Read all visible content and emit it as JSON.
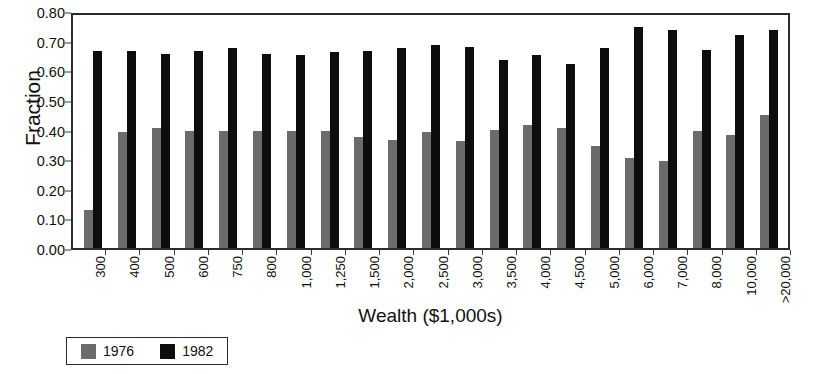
{
  "chart_data": {
    "type": "bar",
    "title": "",
    "xlabel": "Wealth ($1,000s)",
    "ylabel": "Fraction",
    "ylim": [
      0.0,
      0.8
    ],
    "yticks": [
      "0.00",
      "0.10",
      "0.20",
      "0.30",
      "0.40",
      "0.50",
      "0.60",
      "0.70",
      "0.80"
    ],
    "ytick_values": [
      0.0,
      0.1,
      0.2,
      0.3,
      0.4,
      0.5,
      0.6,
      0.7,
      0.8
    ],
    "grid": false,
    "legend_position": "bottom-left",
    "categories": [
      "300",
      "400",
      "500",
      "600",
      "750",
      "800",
      "1,000",
      "1,250",
      "1,500",
      "2,000",
      "2,500",
      "3,000",
      "3,500",
      "4,000",
      "4,500",
      "5,000",
      "6,000",
      "7,000",
      "8,000",
      "10,000",
      ">20,000"
    ],
    "series": [
      {
        "name": "1976",
        "color": "#6b6b6b",
        "values": [
          0.13,
          0.39,
          0.405,
          0.395,
          0.395,
          0.395,
          0.395,
          0.395,
          0.375,
          0.365,
          0.39,
          0.36,
          0.4,
          0.415,
          0.405,
          0.345,
          0.305,
          0.295,
          0.395,
          0.38,
          0.45
        ]
      },
      {
        "name": "1982",
        "color": "#0d0d0d",
        "values": [
          0.665,
          0.665,
          0.655,
          0.665,
          0.675,
          0.655,
          0.65,
          0.66,
          0.665,
          0.675,
          0.685,
          0.68,
          0.635,
          0.65,
          0.62,
          0.675,
          0.745,
          0.735,
          0.67,
          0.72,
          0.735
        ]
      }
    ]
  },
  "legend": {
    "entries": [
      {
        "label": "1976",
        "color": "#6b6b6b"
      },
      {
        "label": "1982",
        "color": "#0d0d0d"
      }
    ]
  }
}
